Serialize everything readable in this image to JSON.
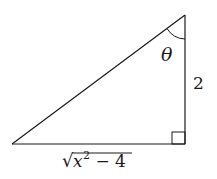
{
  "diagram": {
    "type": "right-triangle",
    "angle_label": "θ",
    "vertical_side_label": "2",
    "base_label": {
      "radical": "√",
      "radicand_var": "x",
      "exponent": "2",
      "rest": " − 4",
      "full": "√(x² − 4)"
    },
    "right_angle_marker": true,
    "colors": {
      "stroke": "#1a1a1a",
      "background": "#ffffff"
    }
  }
}
